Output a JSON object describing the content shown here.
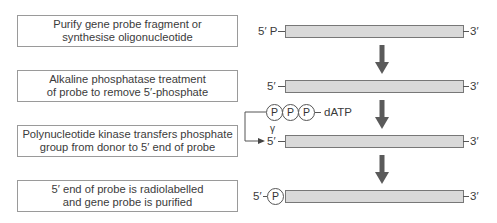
{
  "steps": [
    {
      "line1": "Purify gene probe fragment or",
      "line2": "synthesise oligonucleotide"
    },
    {
      "line1": "Alkaline phosphatase treatment",
      "line2": "of probe to remove 5′-phosphate"
    },
    {
      "line1": "Polynucleotide kinase transfers phosphate",
      "line2": "group from donor to 5′ end of probe"
    },
    {
      "line1": "5′ end of probe is radiolabelled",
      "line2": "and gene probe is purified"
    }
  ],
  "probes": [
    {
      "five_prime": "5′ P",
      "three_prime": "3′"
    },
    {
      "five_prime": "5′",
      "three_prime": "3′"
    },
    {
      "five_prime": "5′",
      "three_prime": "3′"
    },
    {
      "five_prime": "5′",
      "phosphate": "P",
      "three_prime": "3′"
    }
  ],
  "donor": {
    "phosphates": [
      "P",
      "P",
      "P"
    ],
    "name": "dATP",
    "gamma_label": "γ"
  },
  "colors": {
    "probe_fill": "#d9d9d9",
    "arrow": "#5a5a5a",
    "box_border": "#9a9a9a"
  }
}
